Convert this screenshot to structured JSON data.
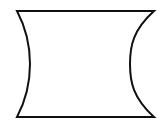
{
  "canvas": {
    "width": 163,
    "height": 127,
    "background_color": "#ffffff"
  },
  "figure": {
    "name": "concave-sided-quadrilateral",
    "stroke_color": "#111111",
    "fill_color": "#ffffff",
    "stroke_width": 2,
    "corners": {
      "top_left": {
        "x": 17,
        "y": 11
      },
      "top_right": {
        "x": 154,
        "y": 11
      },
      "bottom_right": {
        "x": 154,
        "y": 117
      },
      "bottom_left": {
        "x": 17,
        "y": 117
      }
    },
    "edges": [
      {
        "name": "top-edge",
        "type": "straight",
        "from": {
          "x": 17,
          "y": 11
        },
        "to": {
          "x": 154,
          "y": 11
        }
      },
      {
        "name": "right-edge",
        "type": "concave-arc",
        "from": {
          "x": 154,
          "y": 11
        },
        "to": {
          "x": 154,
          "y": 117
        },
        "apex": {
          "x": 130,
          "y": 64
        },
        "bulge_direction": "inward-left",
        "bulge_depth": 24
      },
      {
        "name": "bottom-edge",
        "type": "straight",
        "from": {
          "x": 154,
          "y": 117
        },
        "to": {
          "x": 17,
          "y": 117
        }
      },
      {
        "name": "left-edge",
        "type": "concave-arc",
        "from": {
          "x": 17,
          "y": 117
        },
        "to": {
          "x": 17,
          "y": 11
        },
        "apex": {
          "x": 30,
          "y": 64
        },
        "bulge_direction": "inward-right",
        "bulge_depth": 13
      }
    ],
    "path": "M 17 11 L 154 11 C 133 30 130 46 130 64 C 130 82 133 98 154 117 L 17 117 C 26 100 30 82 30 64 C 30 46 26 28 17 11 Z"
  }
}
